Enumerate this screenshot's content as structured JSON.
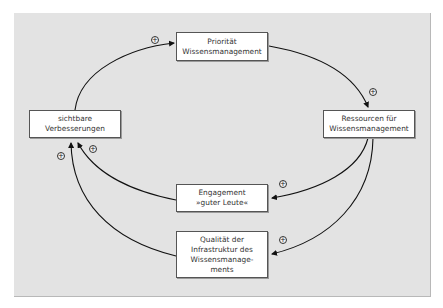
{
  "diagram": {
    "type": "causal-loop",
    "background_color": "#e3e3e3",
    "nodes": [
      {
        "id": "prioritaet",
        "label": "Priorität\nWissensmanagement"
      },
      {
        "id": "ressourcen",
        "label": "Ressourcen für\nWissensmanagement"
      },
      {
        "id": "engagement",
        "label": "Engagement\n»guter Leute«"
      },
      {
        "id": "qualitaet",
        "label": "Qualität der\nInfrastruktur des\nWissensmanage-\nments"
      },
      {
        "id": "verbesserungen",
        "label": "sichtbare\nVerbesserungen"
      }
    ],
    "edges": [
      {
        "from": "verbesserungen",
        "to": "prioritaet",
        "polarity": "+"
      },
      {
        "from": "prioritaet",
        "to": "ressourcen",
        "polarity": "+"
      },
      {
        "from": "ressourcen",
        "to": "engagement",
        "polarity": "+"
      },
      {
        "from": "ressourcen",
        "to": "qualitaet",
        "polarity": "+"
      },
      {
        "from": "engagement",
        "to": "verbesserungen",
        "polarity": "+"
      },
      {
        "from": "qualitaet",
        "to": "verbesserungen",
        "polarity": "+"
      }
    ]
  }
}
